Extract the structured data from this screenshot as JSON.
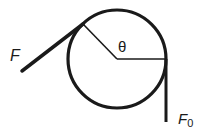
{
  "diagram": {
    "labels": {
      "force_applied": "F",
      "force_holding": "F",
      "force_holding_sub": "0",
      "angle": "θ"
    },
    "colors": {
      "stroke": "#1a1a1a",
      "background": "#ffffff"
    }
  }
}
